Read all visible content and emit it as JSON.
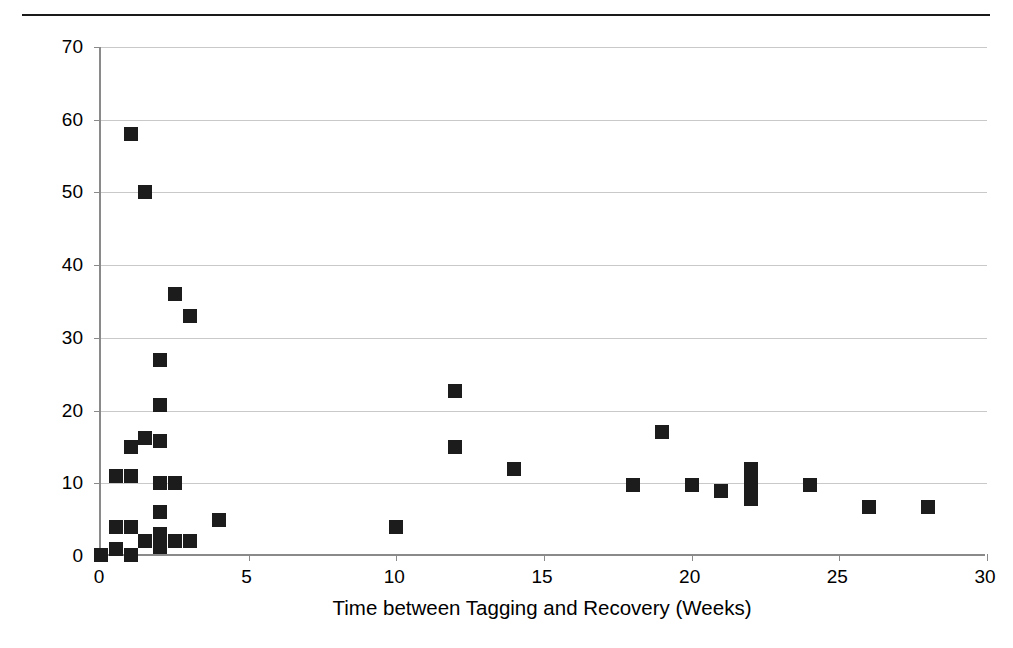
{
  "figure": {
    "clipped_caption_above_rule": "",
    "top_rule": "horizontal-rule"
  },
  "chart_data": {
    "type": "scatter",
    "title": "",
    "xlabel": "Time between Tagging and Recovery (Weeks)",
    "ylabel": "Average Distance Traveled per Day (Miles)",
    "xlim": [
      0,
      30
    ],
    "ylim": [
      0,
      70
    ],
    "xticks": [
      0,
      5,
      10,
      15,
      20,
      25,
      30
    ],
    "yticks": [
      0,
      10,
      20,
      30,
      40,
      50,
      60,
      70
    ],
    "xtick_labels": [
      "0",
      "5",
      "10",
      "15",
      "20",
      "25",
      "30"
    ],
    "ytick_labels": [
      "0",
      "10",
      "20",
      "30",
      "40",
      "50",
      "60",
      "70"
    ],
    "grid": "horizontal",
    "legend": "none",
    "marker": "filled-square",
    "marker_color": "#1c1c1c",
    "gridline_color": "#c9c9c9",
    "axis_color": "#8a8a8a",
    "points": [
      [
        0,
        0.2
      ],
      [
        0.5,
        1.0
      ],
      [
        0.5,
        4.0
      ],
      [
        0.5,
        11.0
      ],
      [
        1.0,
        0.2
      ],
      [
        1.0,
        4.0
      ],
      [
        1.0,
        11.0
      ],
      [
        1.0,
        15.0
      ],
      [
        1.0,
        58.0
      ],
      [
        1.5,
        2.0
      ],
      [
        1.5,
        16.2
      ],
      [
        1.5,
        50.0
      ],
      [
        2.0,
        1.2
      ],
      [
        2.0,
        2.2
      ],
      [
        2.0,
        3.0
      ],
      [
        2.0,
        6.0
      ],
      [
        2.0,
        10.0
      ],
      [
        2.0,
        15.8
      ],
      [
        2.0,
        20.8
      ],
      [
        2.0,
        27.0
      ],
      [
        2.5,
        2.0
      ],
      [
        2.5,
        10.0
      ],
      [
        2.5,
        36.0
      ],
      [
        3.0,
        2.0
      ],
      [
        3.0,
        33.0
      ],
      [
        4.0,
        5.0
      ],
      [
        10.0,
        4.0
      ],
      [
        12.0,
        15.0
      ],
      [
        12.0,
        22.7
      ],
      [
        14.0,
        12.0
      ],
      [
        18.0,
        9.8
      ],
      [
        19.0,
        17.0
      ],
      [
        20.0,
        9.8
      ],
      [
        21.0,
        9.0
      ],
      [
        22.0,
        12.0
      ],
      [
        22.0,
        10.0
      ],
      [
        22.0,
        9.0
      ],
      [
        22.0,
        7.8
      ],
      [
        24.0,
        9.8
      ],
      [
        26.0,
        6.8
      ],
      [
        28.0,
        6.8
      ]
    ]
  }
}
